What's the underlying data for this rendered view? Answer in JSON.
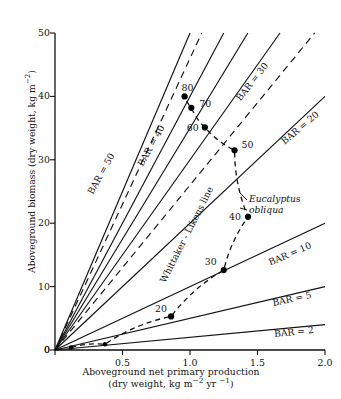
{
  "figure": {
    "xlabel_line1": "Aboveground net primary production",
    "xlabel_line2_pre": "(dry weight, kg m",
    "xlabel_line2_sup1": "−2",
    "xlabel_line2_mid": " yr ",
    "xlabel_line2_sup2": "−1",
    "xlabel_line2_post": ")",
    "ylabel_pre": "Aboveground biomass (dry weight, kg m",
    "ylabel_sup": "−2",
    "ylabel_post": ")",
    "species_line1": "Eucalyptus",
    "species_line2": "obliqua",
    "whittaker_label": "Whittaker - Likens line",
    "axis_color": "#111111",
    "line_color": "#111111",
    "point_color": "#000000"
  },
  "chart_data": {
    "type": "line",
    "title": "",
    "xlabel": "Aboveground net primary production (dry weight, kg m-2 yr-1)",
    "ylabel": "Aboveground biomass (dry weight, kg m-2)",
    "xlim": [
      0,
      2.0
    ],
    "ylim": [
      0,
      50
    ],
    "xticks": [
      0,
      0.5,
      1.0,
      1.5,
      2.0
    ],
    "xticklabels": [
      "0",
      "0.5",
      "1.0",
      "1.5",
      "2.0"
    ],
    "yticks": [
      0,
      10,
      20,
      30,
      40,
      50
    ],
    "yticklabels": [
      "0",
      "10",
      "20",
      "30",
      "40",
      "50"
    ],
    "grid": false,
    "legend": "none",
    "bar_lines": [
      {
        "label": "BAR = 50",
        "slope": 50,
        "style": "solid",
        "lx": 78,
        "ly": 168,
        "rot": -61
      },
      {
        "label": "BAR = 40",
        "slope": 40,
        "style": "solid",
        "lx": 128,
        "ly": 140,
        "rot": -61
      },
      {
        "label": "BAR = 30",
        "slope": 30,
        "style": "solid",
        "lx": 229,
        "ly": 76,
        "rot": -52
      },
      {
        "label": "BAR = 20",
        "slope": 20,
        "style": "solid",
        "lx": 277,
        "ly": 122,
        "rot": -40
      },
      {
        "label": "BAR = 10",
        "slope": 10,
        "style": "solid",
        "lx": 267,
        "ly": 248,
        "rot": -23
      },
      {
        "label": "BAR = 5",
        "slope": 5,
        "style": "solid",
        "lx": 272,
        "ly": 293,
        "rot": -12
      },
      {
        "label": "BAR = 2",
        "slope": 2,
        "style": "solid",
        "lx": 274,
        "ly": 326,
        "rot": -6
      }
    ],
    "dashed_lines": [
      {
        "slope": 46,
        "style": "dashed"
      },
      {
        "slope": 26,
        "style": "dashed"
      }
    ],
    "whittaker_line": {
      "slope": 35,
      "style": "solid",
      "lx": 133,
      "ly": 229,
      "rot": -63
    },
    "series": [
      {
        "name": "Eucalyptus obliqua stand age",
        "style": "dashed",
        "points": [
          {
            "label": "",
            "x": 0.12,
            "y": 0.4
          },
          {
            "label": "",
            "x": 0.37,
            "y": 0.9
          },
          {
            "label": "20",
            "x": 0.86,
            "y": 5.3
          },
          {
            "label": "30",
            "x": 1.25,
            "y": 12.6
          },
          {
            "label": "40",
            "x": 1.43,
            "y": 21.0
          },
          {
            "label": "50",
            "x": 1.33,
            "y": 31.5
          },
          {
            "label": "60",
            "x": 1.11,
            "y": 35.1
          },
          {
            "label": "70",
            "x": 1.01,
            "y": 38.2
          },
          {
            "label": "80",
            "x": 0.96,
            "y": 40.0
          }
        ]
      }
    ],
    "point_label_units": "stand age (years)"
  }
}
